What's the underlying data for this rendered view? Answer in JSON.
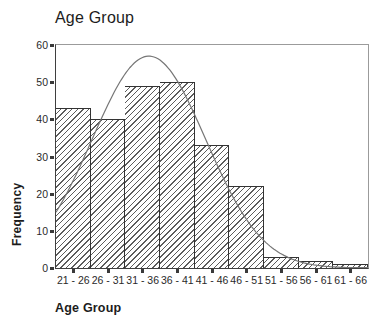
{
  "window": {
    "title": "Age Group"
  },
  "chart_data": {
    "type": "bar",
    "subtype": "histogram-with-normal-curve",
    "title": "Age Group",
    "xlabel": "Age Group",
    "ylabel": "Frequency",
    "categories": [
      "21 - 26",
      "26 - 31",
      "31 - 36",
      "36 - 41",
      "41 - 46",
      "46 - 51",
      "51 - 56",
      "56 - 61",
      "61 - 66"
    ],
    "values": [
      43,
      40,
      49,
      50,
      33,
      22,
      3,
      2,
      1
    ],
    "ylim": [
      0,
      60
    ],
    "yticks": [
      0,
      10,
      20,
      30,
      40,
      50,
      60
    ],
    "grid": false,
    "legend": false,
    "bar_fill": "diagonal-hatch",
    "overlay_curve": {
      "type": "normal",
      "peak_frequency": 57,
      "mean_bin_position": 2.68,
      "sigma_in_bins": 1.64
    },
    "colors": {
      "background": "#ffffff",
      "bar_hatch": "#5c5c5c",
      "bar_border": "#333333",
      "axis_dark": "#3f3f3f",
      "frame_light": "#9b9b9b",
      "curve": "#767676",
      "text": "#1c1c1c"
    }
  }
}
